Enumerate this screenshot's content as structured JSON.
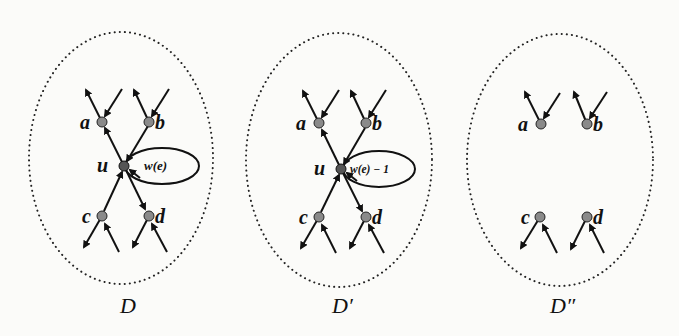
{
  "colors": {
    "background": "#fbfbf9",
    "edge": "#111111",
    "node_fill": "#8a8a8a",
    "node_stroke": "#222222",
    "border": "#222222"
  },
  "panels": [
    {
      "id": "D",
      "caption": "D",
      "has_center": true,
      "center_label": "u",
      "loop_label": "w(e)",
      "nodes": [
        {
          "label": "a"
        },
        {
          "label": "b"
        },
        {
          "label": "c"
        },
        {
          "label": "d"
        }
      ]
    },
    {
      "id": "D_prime",
      "caption": "D′",
      "has_center": true,
      "center_label": "u",
      "loop_label": "w(e) − 1",
      "nodes": [
        {
          "label": "a"
        },
        {
          "label": "b"
        },
        {
          "label": "c"
        },
        {
          "label": "d"
        }
      ]
    },
    {
      "id": "D_double_prime",
      "caption": "D″",
      "has_center": false,
      "nodes": [
        {
          "label": "a"
        },
        {
          "label": "b"
        },
        {
          "label": "c"
        },
        {
          "label": "d"
        }
      ]
    }
  ]
}
